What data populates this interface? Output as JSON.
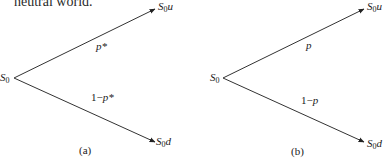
{
  "header": {
    "text": "neutral world."
  },
  "trees": [
    {
      "caption": "(a)",
      "root": {
        "base": "S",
        "sub": "0"
      },
      "up_node": {
        "base": "S",
        "sub": "0",
        "suffix": "u"
      },
      "down_node": {
        "base": "S",
        "sub": "0",
        "suffix": "d"
      },
      "up_prob": {
        "prefix": "",
        "var": "p*"
      },
      "down_prob": {
        "prefix": "1−",
        "var": "p*"
      }
    },
    {
      "caption": "(b)",
      "root": {
        "base": "S",
        "sub": "0"
      },
      "up_node": {
        "base": "S",
        "sub": "0",
        "suffix": "u"
      },
      "down_node": {
        "base": "S",
        "sub": "0",
        "suffix": "d"
      },
      "up_prob": {
        "prefix": "",
        "var": "p"
      },
      "down_prob": {
        "prefix": "1−",
        "var": "p"
      }
    }
  ],
  "colors": {
    "line": "#333333",
    "text": "#1a1a1a"
  }
}
